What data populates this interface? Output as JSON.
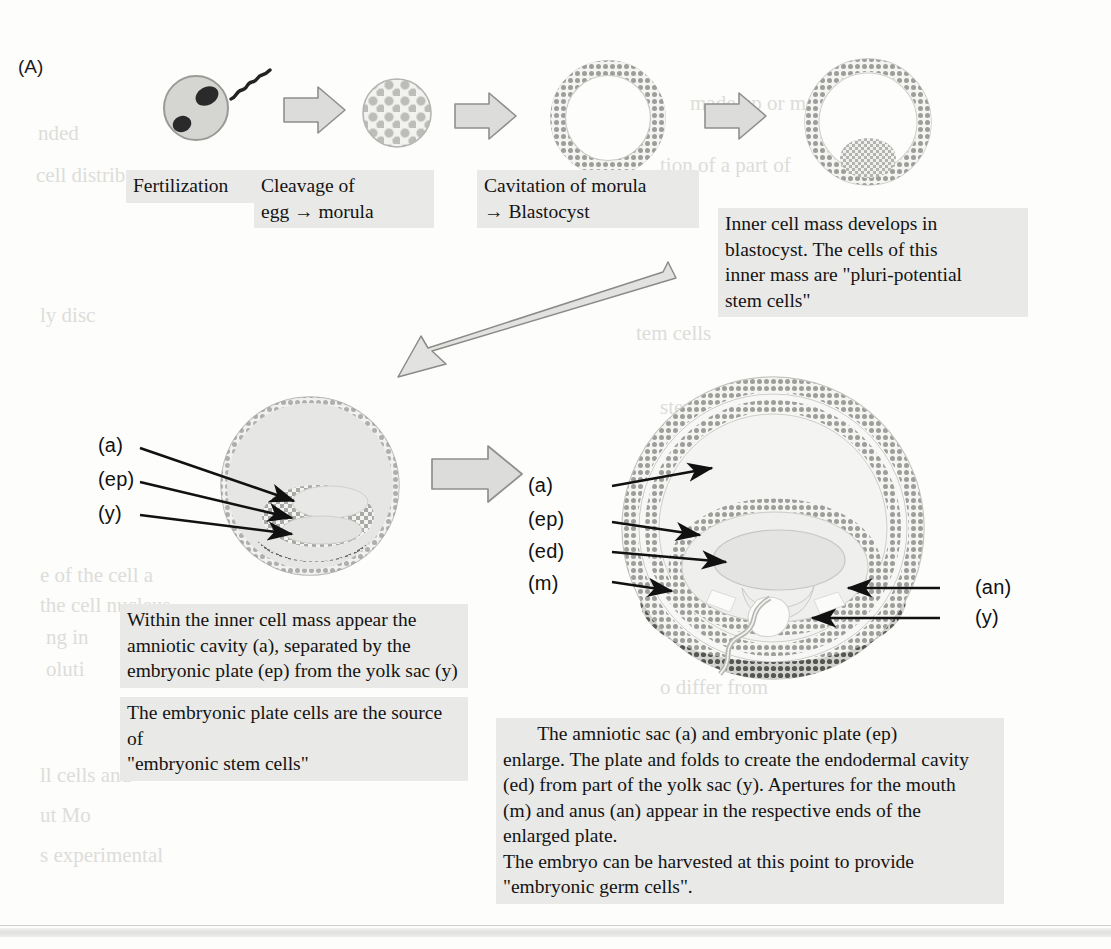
{
  "panel": {
    "letter": "(A)"
  },
  "stages": {
    "fertilization_label": "Fertilization",
    "cleavage_label": "Cleavage of\negg → morula",
    "cavitation_label": "Cavitation of morula\n→ Blastocyst",
    "inner_cell_mass_note": "Inner cell mass develops in\nblastocyst. The cells of this\ninner mass are \"pluri-potential\nstem cells\""
  },
  "left_embryo": {
    "labels": [
      "(a)",
      "(ep)",
      "(y)"
    ],
    "caption_1": "Within the inner cell mass appear the\namniotic cavity (a), separated by the\nembryonic plate (ep) from the yolk sac (y)",
    "caption_2": "The embryonic plate cells are the source of\n\"embryonic stem cells\""
  },
  "right_embryo": {
    "labels_left": [
      "(a)",
      "(ep)",
      "(ed)",
      "(m)"
    ],
    "labels_right": [
      "(an)",
      "(y)"
    ],
    "caption": "       The amniotic sac (a) and embryonic plate (ep)\nenlarge. The plate and folds to create the endodermal cavity\n(ed) from part of the yolk sac (y). Apertures for the mouth\n(m) and anus (an) appear in the respective ends of the\nenlarged plate.\nThe embryo can be harvested at this point to provide\n\"embryonic germ cells\"."
  },
  "icons": {
    "sperm": "sperm-icon",
    "block_arrow": "block-arrow-icon",
    "long_arrow": "long-diagonal-arrow-icon"
  },
  "colors": {
    "caption_bg": "#e9e9e7",
    "text": "#141414",
    "cell_fill": "#d9d9d7",
    "shell": "#9a9a98",
    "dark_shade": "#6f6f6d",
    "bleed": "#d8d8d4"
  },
  "bleed_text": {
    "l1": "nded",
    "l2": "cell distrib",
    "l3": "ly disc",
    "l4": "tem cells",
    "l5": "stem cells",
    "l6": "made up or more",
    "l7": "tion of a part of",
    "l8": "d within mixed exp",
    "l9": "e of the cell a",
    "l10": "the cell nucleus",
    "l11": "ng in",
    "l12": "oluti",
    "l13": "o differ from",
    "l14": "ll cells and",
    "l15": "ut Mo",
    "l16": "s experimental"
  }
}
